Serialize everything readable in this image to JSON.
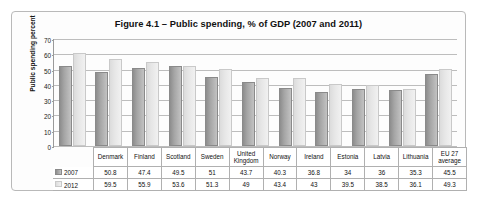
{
  "chart_data": {
    "type": "bar",
    "title": "Figure 4.1 – Public spending, % of GDP (2007 and 2011)",
    "xlabel": "",
    "ylabel": "Public spending percent",
    "ylim": [
      0,
      70
    ],
    "ytick_step": 10,
    "yticks": [
      "70",
      "60",
      "50",
      "40",
      "30",
      "20",
      "10",
      "0"
    ],
    "grid": true,
    "legend_position": "data-table-row-headers",
    "categories": [
      "Denmark",
      "Finland",
      "Scotland",
      "Sweden",
      "United Kingdom",
      "Norway",
      "Ireland",
      "Estonia",
      "Latvia",
      "Lithuania",
      "EU 27 average"
    ],
    "series": [
      {
        "name": "2007",
        "color": "#a5a5a5",
        "values": [
          50.8,
          47.4,
          49.5,
          51,
          43.7,
          40.3,
          36.8,
          34,
          36,
          35.3,
          45.5
        ]
      },
      {
        "name": "2012",
        "color": "#e6e6e6",
        "values": [
          59.5,
          55.9,
          53.6,
          51.3,
          49,
          43.4,
          43,
          39.5,
          38.5,
          36.1,
          49.3
        ]
      }
    ],
    "table": {
      "row_labels": [
        "2007",
        "2012"
      ],
      "rows": [
        [
          "50.8",
          "47.4",
          "49.5",
          "51",
          "43.7",
          "40.3",
          "36.8",
          "34",
          "36",
          "35.3",
          "45.5"
        ],
        [
          "59.5",
          "55.9",
          "53.6",
          "51.3",
          "49",
          "43.4",
          "43",
          "39.5",
          "38.5",
          "36.1",
          "49.3"
        ]
      ]
    }
  }
}
